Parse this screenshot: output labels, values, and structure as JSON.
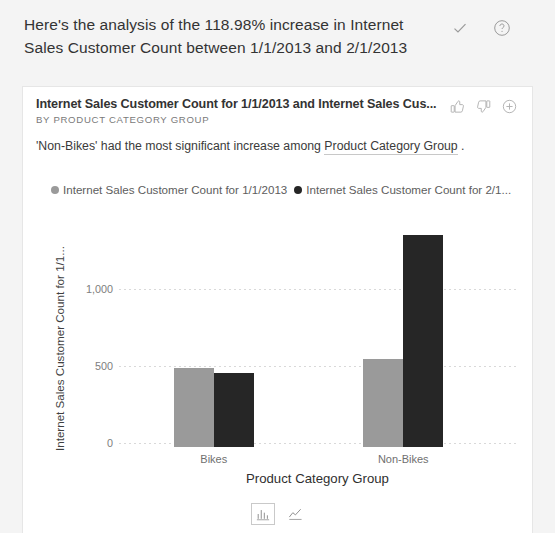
{
  "header": {
    "analysis_text": "Here's the analysis of the 118.98% increase in Internet Sales Customer Count between 1/1/2013 and 2/1/2013",
    "confirm_icon": "check-icon",
    "help_icon": "help-circle-icon"
  },
  "card": {
    "title": "Internet Sales Customer Count for 1/1/2013 and Internet Sales Cus...",
    "subtitle": "BY PRODUCT CATEGORY GROUP",
    "description_prefix": "'Non-Bikes' had the most significant increase among ",
    "description_term": "Product Category Group",
    "description_suffix": " .",
    "actions": {
      "like_icon": "thumbs-up-icon",
      "dislike_icon": "thumbs-down-icon",
      "add_icon": "plus-circle-icon"
    },
    "footer": {
      "bar_chart_label": "bar-chart-icon",
      "line_chart_label": "line-chart-icon",
      "selected": "bar-chart-icon"
    }
  },
  "colors": {
    "series_1": "#9a9a9a",
    "series_2": "#262626",
    "card_background": "#ffffff",
    "page_background": "#f4f4f4",
    "gridline": "#d9d9d9"
  },
  "chart_data": {
    "type": "bar",
    "title": "Internet Sales Customer Count for 1/1/2013 and Internet Sales Cus...",
    "subtitle": "BY PRODUCT CATEGORY GROUP",
    "categories": [
      "Bikes",
      "Non-Bikes"
    ],
    "series": [
      {
        "name": "Internet Sales Customer Count for 1/1/2013",
        "color": "#9a9a9a",
        "values": [
          510,
          570
        ]
      },
      {
        "name": "Internet Sales Customer Count for 2/1...",
        "color": "#262626",
        "values": [
          480,
          1370
        ]
      }
    ],
    "xlabel": "Product Category Group",
    "ylabel": "Internet Sales Customer Count for 1/1...",
    "yticks": [
      0,
      500,
      1000
    ],
    "yticklabels": [
      "0",
      "500",
      "1,000"
    ],
    "ylim": [
      0,
      1450
    ],
    "grid": true,
    "legend_position": "top"
  }
}
